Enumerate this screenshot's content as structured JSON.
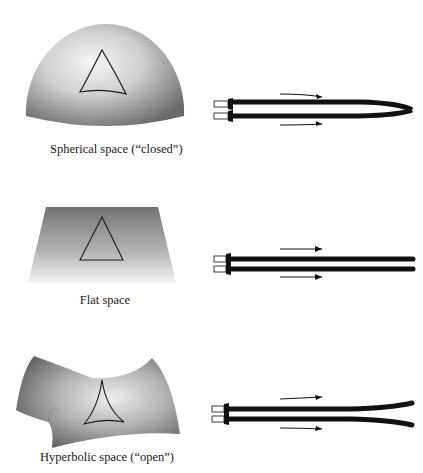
{
  "figure": {
    "panels": [
      {
        "id": "spherical",
        "caption": "Spherical space (“closed”)",
        "beam_behavior": "converging"
      },
      {
        "id": "flat",
        "caption": "Flat space",
        "beam_behavior": "parallel"
      },
      {
        "id": "hyperbolic",
        "caption": "Hyperbolic space (“open”)",
        "beam_behavior": "diverging"
      }
    ]
  },
  "colors": {
    "surface_dark": "#6e6e6e",
    "surface_light": "#f2f2f2",
    "rod": "#111111",
    "line": "#1a1a1a"
  }
}
